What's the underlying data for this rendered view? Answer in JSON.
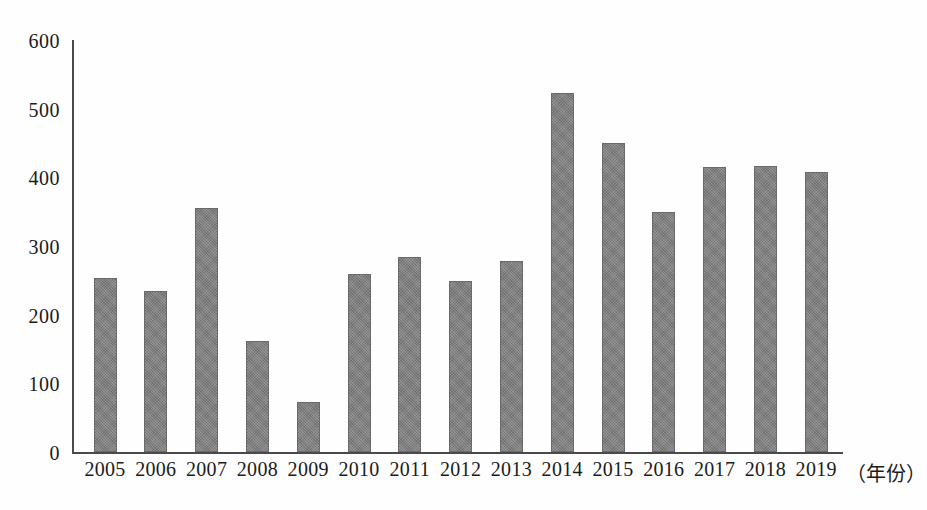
{
  "chart_data": {
    "type": "bar",
    "title": "",
    "subtitle": "",
    "xlabel": "（年份）",
    "ylabel": "",
    "categories": [
      "2005",
      "2006",
      "2007",
      "2008",
      "2009",
      "2010",
      "2011",
      "2012",
      "2013",
      "2014",
      "2015",
      "2016",
      "2017",
      "2018",
      "2019"
    ],
    "values": [
      253,
      235,
      355,
      162,
      73,
      259,
      284,
      249,
      278,
      523,
      450,
      350,
      415,
      417,
      408
    ],
    "series": [
      {
        "name": "",
        "values": [
          253,
          235,
          355,
          162,
          73,
          259,
          284,
          249,
          278,
          523,
          450,
          350,
          415,
          417,
          408
        ]
      }
    ],
    "ylim": [
      0,
      600
    ],
    "ytick_values": [
      0,
      100,
      200,
      300,
      400,
      500,
      600
    ],
    "ytick_labels": [
      "0",
      "100",
      "200",
      "300",
      "400",
      "500",
      "600"
    ],
    "grid": false,
    "legend": false,
    "legend_position": "none",
    "bar_color": "#7e7e7e",
    "bar_border_color": "#6a6a6a",
    "axis_color": "#4a4a4a",
    "text_color": "#1b1b1b"
  }
}
